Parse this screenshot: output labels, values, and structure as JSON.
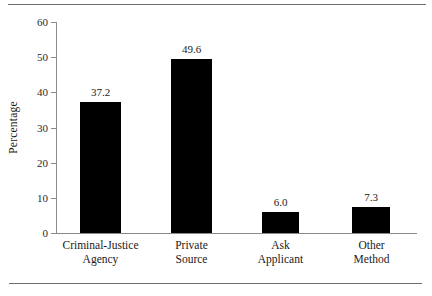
{
  "chart_data": {
    "type": "bar",
    "title": "",
    "subtitle": "",
    "xlabel": "",
    "ylabel": "Percentage",
    "ylim": [
      0,
      60
    ],
    "yticks": [
      0,
      10,
      20,
      30,
      40,
      50,
      60
    ],
    "ytick_labels": [
      "0",
      "10",
      "20",
      "30",
      "40",
      "50",
      "60"
    ],
    "grid": false,
    "legend": null,
    "bar_color": "#000000",
    "axis_color": "#8a8a8a",
    "background": "#ffffff",
    "categories": [
      "Criminal-Justice Agency",
      "Private Source",
      "Ask Applicant",
      "Other Method"
    ],
    "category_lines": [
      [
        "Criminal-Justice",
        "Agency"
      ],
      [
        "Private",
        "Source"
      ],
      [
        "Ask",
        "Applicant"
      ],
      [
        "Other",
        "Method"
      ]
    ],
    "values": [
      37.2,
      49.6,
      6.0,
      7.3
    ],
    "value_labels": [
      "37.2",
      "49.6",
      "6.0",
      "7.3"
    ]
  },
  "figure": {
    "rule_top": "horizontal-rule",
    "rule_bottom": "horizontal-rule"
  }
}
